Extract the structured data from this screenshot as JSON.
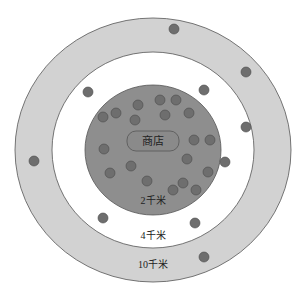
{
  "diagram": {
    "type": "concentric-trade-area",
    "center": {
      "x": 153,
      "y": 150
    },
    "rings": [
      {
        "name": "outer",
        "label": "10千米",
        "radius_x": 138,
        "radius_y": 132,
        "fill": "#d2d2d2",
        "label_pos": {
          "x": 153,
          "y": 268
        }
      },
      {
        "name": "middle",
        "label": "4千米",
        "radius_x": 101,
        "radius_y": 98,
        "fill": "#ffffff",
        "label_pos": {
          "x": 153,
          "y": 239
        }
      },
      {
        "name": "inner",
        "label": "2千米",
        "radius_x": 68,
        "radius_y": 65,
        "fill": "#8e8e8e",
        "label_pos": {
          "x": 153,
          "y": 204
        }
      }
    ],
    "store": {
      "label": "商店",
      "x": 153,
      "y": 141,
      "width": 52,
      "height": 20
    },
    "dot_color": "#6e6e6e",
    "dots": [
      {
        "x": 174,
        "y": 29
      },
      {
        "x": 246,
        "y": 72
      },
      {
        "x": 34,
        "y": 161
      },
      {
        "x": 204,
        "y": 257
      },
      {
        "x": 88,
        "y": 92
      },
      {
        "x": 204,
        "y": 90
      },
      {
        "x": 246,
        "y": 127
      },
      {
        "x": 103,
        "y": 218
      },
      {
        "x": 195,
        "y": 223
      },
      {
        "x": 225,
        "y": 162
      },
      {
        "x": 103,
        "y": 117
      },
      {
        "x": 116,
        "y": 113
      },
      {
        "x": 138,
        "y": 105
      },
      {
        "x": 135,
        "y": 120
      },
      {
        "x": 160,
        "y": 100
      },
      {
        "x": 176,
        "y": 100
      },
      {
        "x": 165,
        "y": 115
      },
      {
        "x": 189,
        "y": 113
      },
      {
        "x": 104,
        "y": 149
      },
      {
        "x": 110,
        "y": 173
      },
      {
        "x": 131,
        "y": 166
      },
      {
        "x": 147,
        "y": 181
      },
      {
        "x": 194,
        "y": 140
      },
      {
        "x": 210,
        "y": 140
      },
      {
        "x": 187,
        "y": 159
      },
      {
        "x": 208,
        "y": 172
      },
      {
        "x": 183,
        "y": 183
      },
      {
        "x": 173,
        "y": 190
      },
      {
        "x": 196,
        "y": 190
      }
    ]
  }
}
